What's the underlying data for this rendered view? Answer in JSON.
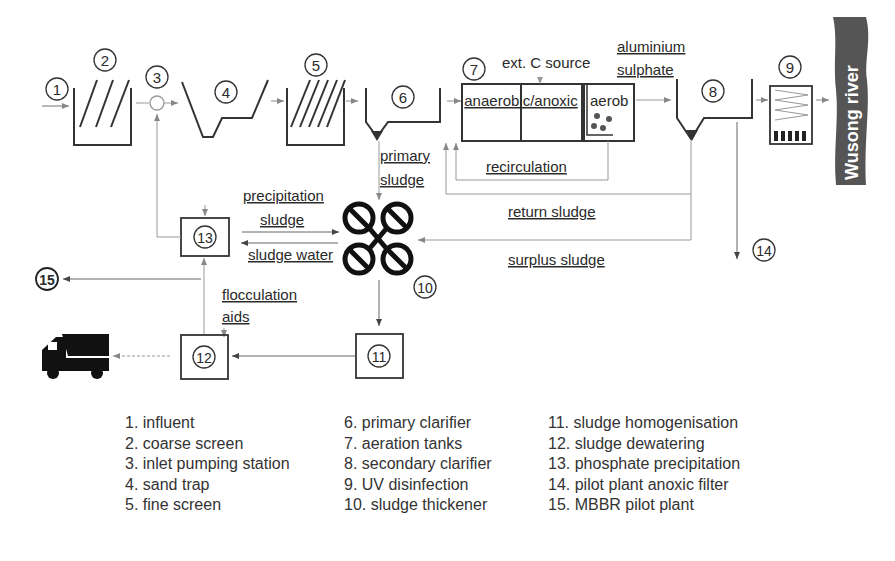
{
  "diagram": {
    "node_numbers": [
      "1",
      "2",
      "3",
      "4",
      "5",
      "6",
      "7",
      "8",
      "9",
      "10",
      "11",
      "12",
      "13",
      "14",
      "15"
    ],
    "labels": {
      "ext_c_source": "ext. C source",
      "aluminium": "aluminium",
      "sulphate": "sulphate",
      "anaerobic_anoxic": "anaerobic/anoxic",
      "aerob": "aerob",
      "primary": "primary",
      "sludge_primary": "sludge",
      "recirculation": "recirculation",
      "return_sludge": "return sludge",
      "surplus_sludge": "surplus sludge",
      "precipitation": "precipitation",
      "sludge_precip": "sludge",
      "sludge_water": "sludge water",
      "flocculation": "flocculation",
      "aids": "aids",
      "river": "Wusong  river"
    },
    "colors": {
      "line_dark": "#2a2a2a",
      "line_light": "#9a9a9a",
      "river": "#555555",
      "river_text": "#ffffff"
    }
  },
  "legend": {
    "col1": [
      "1. influent",
      "2. coarse screen",
      "3. inlet pumping station",
      "4. sand trap",
      "5. fine screen"
    ],
    "col2": [
      "6. primary clarifier",
      "7. aeration tanks",
      "8. secondary clarifier",
      "9. UV disinfection",
      "10. sludge thickener"
    ],
    "col3": [
      "11. sludge homogenisation",
      "12. sludge dewatering",
      "13. phosphate precipitation",
      "14. pilot plant anoxic filter",
      "15. MBBR pilot plant"
    ]
  }
}
